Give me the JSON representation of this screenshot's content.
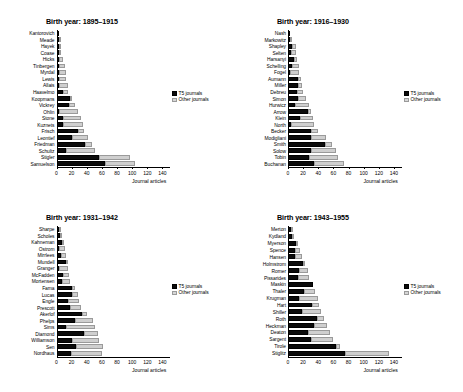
{
  "figure": {
    "xlabel": "Journal articles",
    "legend": {
      "t5": "T5 journals",
      "other": "Other journals"
    },
    "colors": {
      "t5": "#0b0b0b",
      "other": "#d0d0d0"
    },
    "xticks": [
      "0",
      "20",
      "40",
      "60",
      "80",
      "100",
      "120",
      "140"
    ],
    "xlim": [
      0,
      150
    ]
  },
  "chart_data": [
    {
      "type": "bar",
      "orientation": "horizontal",
      "stacked": true,
      "title": "Birth year: 1895–1915",
      "xlabel": "Journal articles",
      "ylabel": "",
      "xlim": [
        0,
        150
      ],
      "xticks": [
        0,
        20,
        40,
        60,
        80,
        100,
        120,
        140
      ],
      "grid": false,
      "legend_position": "right",
      "categories": [
        "Kantorovich",
        "Meade",
        "Hayek",
        "Coase",
        "Hicks",
        "Tinbergen",
        "Myrdal",
        "Lewis",
        "Allais",
        "Haavelmo",
        "Koopmans",
        "Vickrey",
        "Ohlin",
        "Stone",
        "Kuznets",
        "Frisch",
        "Leontief",
        "Friedman",
        "Schultz",
        "Stigler",
        "Samuelson"
      ],
      "series": [
        {
          "name": "T5 journals",
          "values": [
            1,
            2,
            2,
            3,
            3,
            2,
            2,
            3,
            2,
            9,
            18,
            16,
            2,
            9,
            9,
            28,
            21,
            38,
            13,
            56,
            64
          ]
        },
        {
          "name": "Other journals",
          "values": [
            0,
            1,
            3,
            3,
            5,
            8,
            10,
            10,
            13,
            6,
            2,
            8,
            26,
            23,
            26,
            9,
            20,
            9,
            38,
            41,
            40
          ]
        }
      ],
      "totals": [
        1,
        3,
        5,
        6,
        8,
        10,
        12,
        13,
        15,
        15,
        20,
        24,
        28,
        32,
        35,
        37,
        41,
        47,
        51,
        97,
        104
      ]
    },
    {
      "type": "bar",
      "orientation": "horizontal",
      "stacked": true,
      "title": "Birth year: 1916–1930",
      "xlabel": "Journal articles",
      "ylabel": "",
      "xlim": [
        0,
        150
      ],
      "xticks": [
        0,
        20,
        40,
        60,
        80,
        100,
        120,
        140
      ],
      "grid": false,
      "legend_position": "right",
      "categories": [
        "Nash",
        "Markowitz",
        "Shapley",
        "Selten",
        "Harsanyi",
        "Schelling",
        "Fogel",
        "Aumann",
        "Miller",
        "Debreu",
        "Simon",
        "Hurwicz",
        "Arrow",
        "Klein",
        "North",
        "Becker",
        "Modigliani",
        "Smith",
        "Solow",
        "Tobin",
        "Buchanan"
      ],
      "series": [
        {
          "name": "T5 journals",
          "values": [
            3,
            3,
            5,
            4,
            8,
            5,
            3,
            13,
            13,
            12,
            13,
            9,
            27,
            16,
            4,
            30,
            30,
            49,
            30,
            28,
            34
          ]
        },
        {
          "name": "Other journals",
          "values": [
            0,
            2,
            5,
            7,
            4,
            9,
            12,
            4,
            6,
            8,
            11,
            19,
            4,
            17,
            30,
            10,
            20,
            9,
            33,
            38,
            40
          ]
        }
      ],
      "totals": [
        3,
        5,
        10,
        11,
        12,
        14,
        15,
        17,
        19,
        20,
        24,
        28,
        31,
        33,
        34,
        40,
        50,
        58,
        63,
        66,
        74
      ]
    },
    {
      "type": "bar",
      "orientation": "horizontal",
      "stacked": true,
      "title": "Birth year: 1931–1942",
      "xlabel": "Journal articles",
      "ylabel": "",
      "xlim": [
        0,
        150
      ],
      "xticks": [
        0,
        20,
        40,
        60,
        80,
        100,
        120,
        140
      ],
      "grid": false,
      "legend_position": "right",
      "categories": [
        "Sharpe",
        "Scholes",
        "Kahneman",
        "Ostrom",
        "Mirrlees",
        "Mundell",
        "Granger",
        "McFadden",
        "Mortensen",
        "Fama",
        "Lucas",
        "Engle",
        "Prescott",
        "Akerlof",
        "Phelps",
        "Sims",
        "Diamond",
        "Williamson",
        "Sen",
        "Nordhaus"
      ],
      "series": [
        {
          "name": "T5 journals",
          "values": [
            2,
            5,
            7,
            2,
            6,
            12,
            2,
            8,
            7,
            20,
            21,
            15,
            18,
            34,
            25,
            13,
            37,
            21,
            26,
            19
          ]
        },
        {
          "name": "Other journals",
          "values": [
            1,
            1,
            3,
            8,
            7,
            2,
            13,
            9,
            11,
            5,
            7,
            15,
            14,
            6,
            23,
            38,
            18,
            35,
            35,
            41
          ]
        }
      ],
      "totals": [
        3,
        6,
        10,
        10,
        13,
        14,
        15,
        17,
        18,
        25,
        28,
        30,
        32,
        40,
        48,
        51,
        55,
        56,
        61,
        60
      ]
    },
    {
      "type": "bar",
      "orientation": "horizontal",
      "stacked": true,
      "title": "Birth year: 1943–1955",
      "xlabel": "Journal articles",
      "ylabel": "",
      "xlim": [
        0,
        150
      ],
      "xticks": [
        0,
        20,
        40,
        60,
        80,
        100,
        120,
        140
      ],
      "grid": false,
      "legend_position": "right",
      "categories": [
        "Merton",
        "Kydland",
        "Myerson",
        "Spence",
        "Hansen",
        "Holmstrom",
        "Romer",
        "Pissarides",
        "Maskin",
        "Thaler",
        "Krugman",
        "Hart",
        "Shiller",
        "Roth",
        "Heckman",
        "Deaton",
        "Sargent",
        "Tirole",
        "Stiglitz"
      ],
      "series": [
        {
          "name": "T5 journals",
          "values": [
            4,
            5,
            10,
            9,
            9,
            20,
            15,
            13,
            33,
            21,
            15,
            32,
            19,
            38,
            35,
            26,
            31,
            64,
            75
          ]
        },
        {
          "name": "Other journals",
          "values": [
            1,
            3,
            2,
            7,
            9,
            3,
            11,
            15,
            0,
            15,
            24,
            9,
            24,
            9,
            17,
            30,
            28,
            5,
            58
          ]
        }
      ],
      "totals": [
        5,
        8,
        12,
        16,
        18,
        23,
        26,
        28,
        33,
        36,
        39,
        41,
        43,
        47,
        52,
        56,
        59,
        69,
        133
      ]
    }
  ]
}
